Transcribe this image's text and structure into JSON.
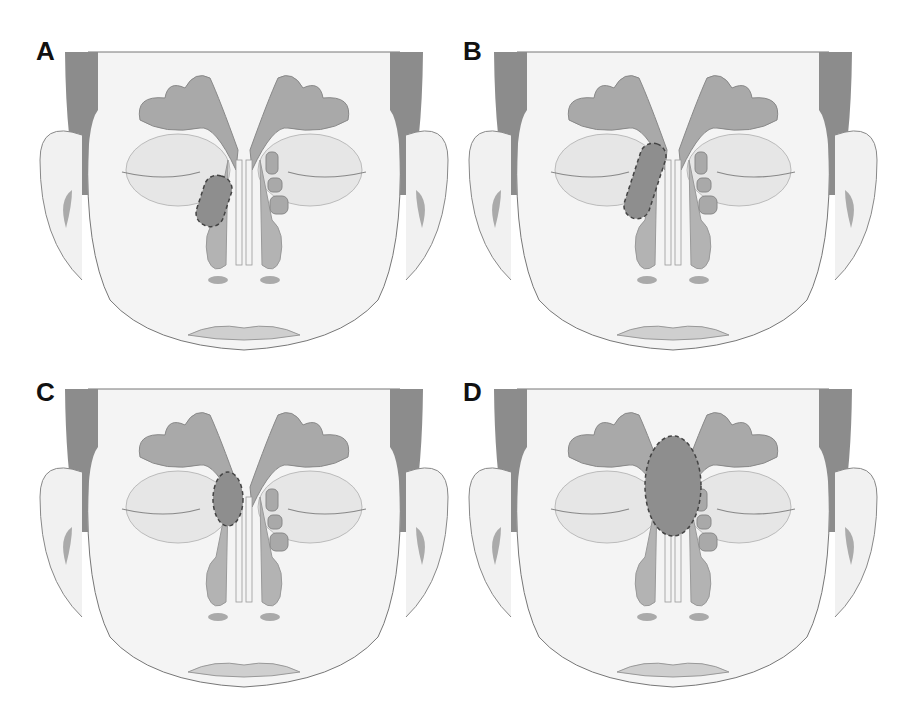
{
  "figure": {
    "colors": {
      "background": "#ffffff",
      "skin": "#f4f4f4",
      "outline": "#777777",
      "hair": "#8c8c8c",
      "sinus_fill": "#a9a9a9",
      "orbit_fill": "#e2e2e2",
      "highlight_fill": "#8e8e8e",
      "highlight_stroke": "#444444"
    },
    "panels": [
      {
        "label": "A",
        "highlight": "small oblique oval region in right ethmoid / lateral nasal wall area"
      },
      {
        "label": "B",
        "highlight": "elongated oblique oval region extending from frontal recess along right ethmoid"
      },
      {
        "label": "C",
        "highlight": "small vertical ellipse at right frontal recess / upper ethmoid"
      },
      {
        "label": "D",
        "highlight": "large midline ellipse spanning frontal sinus to ethmoid region"
      }
    ]
  }
}
